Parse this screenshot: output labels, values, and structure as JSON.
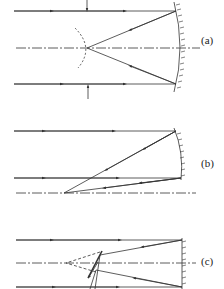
{
  "figure": {
    "panels": [
      {
        "id": "a",
        "label": "(a)",
        "description": "Parallel rays reflected by concave mirror converge to a focal point on axis; curved dashed wavefront near focus; vertical arrows mark beam edges"
      },
      {
        "id": "b",
        "label": "(b)",
        "description": "Off-axis parallel rays reflected by a mirror converge to a point on the lower axis line"
      },
      {
        "id": "c",
        "label": "(c)",
        "description": "Parallel rays reflected by a flat mirror with a small tilted secondary element near focus; dashed extension lines converge on axis"
      }
    ],
    "colors": {
      "line": "#333333",
      "background": "#ffffff"
    }
  }
}
